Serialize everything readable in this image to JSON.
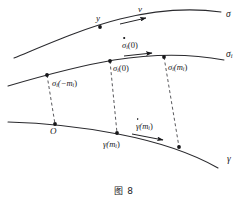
{
  "figure": {
    "caption": "图 8",
    "caption_x": 0,
    "caption_y": 184,
    "width": 248,
    "height": 206,
    "background": "#ffffff",
    "ink_color": "#17171a",
    "curve_color": "#2a2a2e",
    "dash_color": "#3a3a3e"
  },
  "curves": [
    {
      "id": "sigma",
      "label": "σ",
      "label_x": 226,
      "label_y": 12,
      "stroke": "#2a2a2e",
      "width": 1.05,
      "path": "M 14,58 C 48,44 84,28 120,19 C 156,10 192,8 221,12"
    },
    {
      "id": "sigma-i",
      "label_base": "σ",
      "label_sub": "i",
      "label_x": 226,
      "label_y": 53,
      "stroke": "#2a2a2e",
      "width": 1.05,
      "path": "M 8,86 C 42,76 78,66 114,60 C 152,54 192,54 224,60"
    },
    {
      "id": "gamma",
      "label": "γ",
      "label_x": 226,
      "label_y": 158,
      "stroke": "#2a2a2e",
      "width": 1.05,
      "path": "M 8,122 C 44,123 82,127 118,134 C 154,141 190,152 218,168"
    }
  ],
  "points": [
    {
      "id": "y-on-sigma",
      "curve": "sigma",
      "x": 100,
      "y": 27,
      "r": 1.9
    },
    {
      "id": "sigma-i-neg-mi",
      "curve": "sigma-i",
      "x": 47,
      "y": 75,
      "r": 1.9
    },
    {
      "id": "sigma-i-zero",
      "curve": "sigma-i",
      "x": 110,
      "y": 61,
      "r": 1.9
    },
    {
      "id": "sigma-i-mi",
      "curve": "sigma-i",
      "x": 164,
      "y": 57,
      "r": 1.9
    },
    {
      "id": "origin-O",
      "curve": "gamma",
      "x": 55,
      "y": 124,
      "r": 1.9
    },
    {
      "id": "gamma-mi",
      "curve": "gamma",
      "x": 117,
      "y": 133,
      "r": 1.9
    },
    {
      "id": "gamma-right",
      "curve": "gamma",
      "x": 179,
      "y": 147,
      "r": 1.9
    }
  ],
  "connectors": [
    {
      "id": "connector-left",
      "x1": 47,
      "y1": 75,
      "x2": 55,
      "y2": 124
    },
    {
      "id": "connector-middle",
      "x1": 110,
      "y1": 61,
      "x2": 117,
      "y2": 133
    },
    {
      "id": "connector-right",
      "x1": 164,
      "y1": 57,
      "x2": 179,
      "y2": 147
    }
  ],
  "arrows": [
    {
      "id": "arrow-v",
      "x1": 120,
      "y1": 24,
      "x2": 146,
      "y2": 18
    },
    {
      "id": "arrow-sigma-i-dot",
      "x1": 124,
      "y1": 56,
      "x2": 152,
      "y2": 53
    },
    {
      "id": "arrow-gamma-dot",
      "x1": 132,
      "y1": 134,
      "x2": 163,
      "y2": 140
    }
  ],
  "labels": {
    "y_point": {
      "text": "y",
      "x": 96,
      "y": 14
    },
    "v_vector": {
      "text": "v",
      "x": 138,
      "y": 5
    },
    "sigma_curve": {
      "text": "σ",
      "x": 226,
      "y": 10
    },
    "gamma_curve": {
      "text": "γ",
      "x": 227,
      "y": 155
    },
    "origin": {
      "text": "O",
      "x": 50,
      "y": 127
    },
    "sigma_i_dot_0": {
      "base": "σ",
      "sub": "i",
      "arg": "(0)",
      "x": 122,
      "y": 41
    },
    "sigma_i_neg": {
      "base": "σ",
      "sub": "i",
      "arg": "(−m",
      "sub2": "i",
      "close": ")",
      "x": 52,
      "y": 79
    },
    "sigma_i_0": {
      "base": "σ",
      "sub": "i",
      "arg": "(0)",
      "x": 113,
      "y": 64
    },
    "sigma_i_mi": {
      "base": "σ",
      "sub": "i",
      "arg": "(m",
      "sub2": "i",
      "close": ")",
      "x": 168,
      "y": 63
    },
    "gamma_mi": {
      "base": "γ",
      "arg": "(m",
      "sub2": "i",
      "close": ")",
      "x": 103,
      "y": 140
    },
    "gamma_dot_mi": {
      "base": "γ",
      "arg": "(m",
      "sub2": "i",
      "close": ")",
      "x": 136,
      "y": 122
    },
    "sigma_i_label": {
      "base": "σ",
      "sub": "i",
      "x": 226,
      "y": 50
    }
  }
}
